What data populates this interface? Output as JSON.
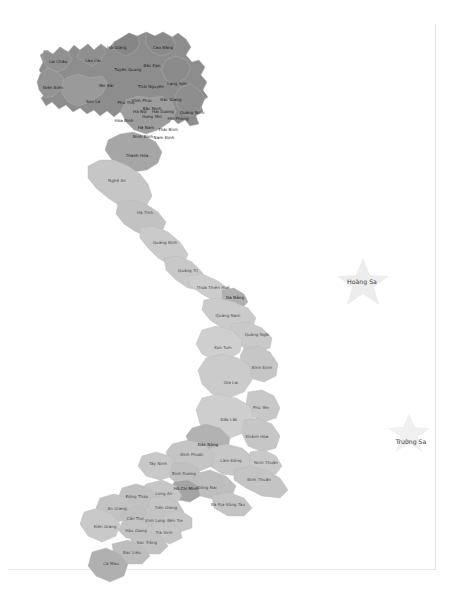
{
  "document": {
    "title": "Bản đồ hành chính Việt Nam",
    "caption": "",
    "background_color": "#ffffff",
    "border_color": "#e2e2e2"
  },
  "map": {
    "name": "vietnam-provinces-map",
    "type": "choropleth",
    "country": "Việt Nam",
    "palette": {
      "north_dark": "#8e8e8e",
      "north_mid": "#9d9d9d",
      "north_light": "#a8a8a8",
      "central_light": "#cfcfcf",
      "central_mid": "#c2c2c2",
      "south_mid": "#b4b4b4",
      "south_light": "#c8c8c8",
      "delta_dark": "#a0a0a0",
      "island_fill": "#ececec",
      "stroke": "#b7b7b7"
    },
    "islands": [
      {
        "name": "Hoàng Sa",
        "label": "Hoàng Sa",
        "x": 363,
        "y": 281,
        "star_x": 363,
        "star_y": 279,
        "star_size": 42,
        "label_x": 362,
        "label_y": 281
      },
      {
        "name": "Trường Sa",
        "label": "Trường Sa",
        "x": 409,
        "y": 441,
        "star_x": 409,
        "star_y": 430,
        "star_size": 34,
        "label_x": 411,
        "label_y": 441
      }
    ],
    "provinces": [
      {
        "name": "Hà Giang",
        "label": "Hà Giang",
        "x": 117,
        "y": 48,
        "tone": "dark"
      },
      {
        "name": "Cao Bằng",
        "label": "Cao Bằng",
        "x": 163,
        "y": 48,
        "tone": "dark"
      },
      {
        "name": "Lai Châu",
        "label": "Lai Châu",
        "x": 58,
        "y": 62,
        "tone": "dark"
      },
      {
        "name": "Lào Cai",
        "label": "Lào Cai",
        "x": 93,
        "y": 61,
        "tone": "dark"
      },
      {
        "name": "Tuyên Quang",
        "label": "Tuyên Quang",
        "x": 128,
        "y": 70,
        "tone": "dark",
        "two": true
      },
      {
        "name": "Bắc Kạn",
        "label": "Bắc Kạn",
        "x": 152,
        "y": 66,
        "tone": "dark"
      },
      {
        "name": "Điện Biên",
        "label": "Điện Biên",
        "x": 53,
        "y": 88,
        "tone": "dark"
      },
      {
        "name": "Yên Bái",
        "label": "Yên Bái",
        "x": 106,
        "y": 86,
        "tone": "dark"
      },
      {
        "name": "Thái Nguyên",
        "label": "Thái Nguyên",
        "x": 151,
        "y": 87,
        "tone": "dark",
        "two": true
      },
      {
        "name": "Lạng Sơn",
        "label": "Lạng Sơn",
        "x": 177,
        "y": 84,
        "tone": "dark"
      },
      {
        "name": "Sơn La",
        "label": "Sơn La",
        "x": 93,
        "y": 102,
        "tone": "dark"
      },
      {
        "name": "Phú Thọ",
        "label": "Phú Thọ",
        "x": 126,
        "y": 103,
        "tone": "dark"
      },
      {
        "name": "Vĩnh Phúc",
        "label": "Vĩnh Phúc",
        "x": 142,
        "y": 101,
        "tone": "dark"
      },
      {
        "name": "Bắc Giang",
        "label": "Bắc Giang",
        "x": 171,
        "y": 100,
        "tone": "dark"
      },
      {
        "name": "Bắc Ninh",
        "label": "Bắc Ninh",
        "x": 152,
        "y": 109,
        "tone": "dark"
      },
      {
        "name": "Hà Nội",
        "label": "Hà Nội",
        "x": 140,
        "y": 112,
        "tone": "dark"
      },
      {
        "name": "Hải Dương",
        "label": "Hải Dương",
        "x": 163,
        "y": 112,
        "tone": "dark"
      },
      {
        "name": "Quảng Ninh",
        "label": "Quảng Ninh",
        "x": 192,
        "y": 113,
        "tone": "dark"
      },
      {
        "name": "Hưng Yên",
        "label": "Hưng Yên",
        "x": 152,
        "y": 117,
        "tone": "dark"
      },
      {
        "name": "Hải Phòng",
        "label": "Hải Phòng",
        "x": 178,
        "y": 119,
        "tone": "dark"
      },
      {
        "name": "Hòa Bình",
        "label": "Hòa Bình",
        "x": 124,
        "y": 121,
        "tone": "dark"
      },
      {
        "name": "Hà Nam",
        "label": "Hà Nam",
        "x": 146,
        "y": 128,
        "tone": "dark"
      },
      {
        "name": "Thái Bình",
        "label": "Thái Bình",
        "x": 168,
        "y": 130,
        "tone": "dark"
      },
      {
        "name": "Ninh Bình",
        "label": "Ninh Bình",
        "x": 143,
        "y": 137,
        "tone": "dark"
      },
      {
        "name": "Nam Định",
        "label": "Nam Định",
        "x": 164,
        "y": 138,
        "tone": "dark"
      },
      {
        "name": "Thanh Hóa",
        "label": "Thanh Hóa",
        "x": 137,
        "y": 156,
        "tone": "dark"
      },
      {
        "name": "Nghệ An",
        "label": "Nghệ An",
        "x": 117,
        "y": 181,
        "tone": "light"
      },
      {
        "name": "Hà Tĩnh",
        "label": "Hà Tĩnh",
        "x": 145,
        "y": 213,
        "tone": "light"
      },
      {
        "name": "Quảng Bình",
        "label": "Quảng Bình",
        "x": 165,
        "y": 243,
        "tone": "light"
      },
      {
        "name": "Quảng Trị",
        "label": "Quảng Trị",
        "x": 188,
        "y": 271,
        "tone": "light"
      },
      {
        "name": "Thừa Thiên Huế",
        "label": "Thừa Thiên Huế",
        "x": 213,
        "y": 288,
        "tone": "light"
      },
      {
        "name": "Đà Nẵng",
        "label": "Đà Nẵng",
        "x": 235,
        "y": 298,
        "tone": "dark"
      },
      {
        "name": "Quảng Nam",
        "label": "Quảng Nam",
        "x": 228,
        "y": 316,
        "tone": "light"
      },
      {
        "name": "Quảng Ngãi",
        "label": "Quảng Ngãi",
        "x": 257,
        "y": 335,
        "tone": "light"
      },
      {
        "name": "Kon Tum",
        "label": "Kon Tum",
        "x": 223,
        "y": 348,
        "tone": "light"
      },
      {
        "name": "Bình Định",
        "label": "Bình Định",
        "x": 262,
        "y": 368,
        "tone": "light"
      },
      {
        "name": "Gia Lai",
        "label": "Gia Lai",
        "x": 231,
        "y": 383,
        "tone": "light"
      },
      {
        "name": "Phú Yên",
        "label": "Phú Yên",
        "x": 261,
        "y": 408,
        "tone": "light"
      },
      {
        "name": "Đắk Lắk",
        "label": "Đắk Lắk",
        "x": 229,
        "y": 420,
        "tone": "light"
      },
      {
        "name": "Khánh Hòa",
        "label": "Khánh Hòa",
        "x": 257,
        "y": 437,
        "tone": "light"
      },
      {
        "name": "Đắk Nông",
        "label": "Đắk Nông",
        "x": 208,
        "y": 445,
        "tone": "dark"
      },
      {
        "name": "Lâm Đồng",
        "label": "Lâm Đồng",
        "x": 231,
        "y": 461,
        "tone": "light"
      },
      {
        "name": "Ninh Thuận",
        "label": "Ninh Thuận",
        "x": 266,
        "y": 463,
        "tone": "light"
      },
      {
        "name": "Bình Phước",
        "label": "Bình Phước",
        "x": 192,
        "y": 455,
        "tone": "light"
      },
      {
        "name": "Tây Ninh",
        "label": "Tây Ninh",
        "x": 158,
        "y": 464,
        "tone": "light"
      },
      {
        "name": "Bình Thuận",
        "label": "Bình Thuận",
        "x": 259,
        "y": 480,
        "tone": "light"
      },
      {
        "name": "Bình Dương",
        "label": "Bình Dương",
        "x": 184,
        "y": 474,
        "tone": "light",
        "two": true
      },
      {
        "name": "Đồng Nai",
        "label": "Đồng Nai",
        "x": 207,
        "y": 488,
        "tone": "light"
      },
      {
        "name": "Hồ Chí Minh",
        "label": "Hồ Chí Minh",
        "x": 186,
        "y": 489,
        "tone": "dark",
        "two": true
      },
      {
        "name": "Long An",
        "label": "Long An",
        "x": 164,
        "y": 494,
        "tone": "light"
      },
      {
        "name": "Bà Rịa-Vũng Tàu",
        "label": "Bà Rịa-Vũng Tàu",
        "x": 228,
        "y": 505,
        "tone": "light"
      },
      {
        "name": "Đồng Tháp",
        "label": "Đồng Tháp",
        "x": 137,
        "y": 497,
        "tone": "light",
        "two": true
      },
      {
        "name": "Tiền Giang",
        "label": "Tiền Giang",
        "x": 166,
        "y": 508,
        "tone": "light"
      },
      {
        "name": "An Giang",
        "label": "An Giang",
        "x": 117,
        "y": 509,
        "tone": "light"
      },
      {
        "name": "Cần Thơ",
        "label": "Cần Thơ",
        "x": 135,
        "y": 519,
        "tone": "light",
        "two": true
      },
      {
        "name": "Vĩnh Long",
        "label": "Vĩnh Long",
        "x": 155,
        "y": 521,
        "tone": "light",
        "two": true
      },
      {
        "name": "Bến Tre",
        "label": "Bến Tre",
        "x": 175,
        "y": 521,
        "tone": "light"
      },
      {
        "name": "Kiên Giang",
        "label": "Kiên Giang",
        "x": 105,
        "y": 527,
        "tone": "light"
      },
      {
        "name": "Hậu Giang",
        "label": "Hậu Giang",
        "x": 136,
        "y": 531,
        "tone": "light",
        "two": true
      },
      {
        "name": "Trà Vinh",
        "label": "Trà Vinh",
        "x": 164,
        "y": 533,
        "tone": "light"
      },
      {
        "name": "Sóc Trăng",
        "label": "Sóc Trăng",
        "x": 147,
        "y": 543,
        "tone": "light"
      },
      {
        "name": "Bạc Liêu",
        "label": "Bạc Liêu",
        "x": 132,
        "y": 553,
        "tone": "light"
      },
      {
        "name": "Cà Mau",
        "label": "Cà Mau",
        "x": 111,
        "y": 564,
        "tone": "light"
      }
    ]
  }
}
